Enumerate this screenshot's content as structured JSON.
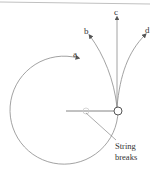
{
  "diagram": {
    "type": "circular-motion-trajectory",
    "labels": {
      "a": "a",
      "b": "b",
      "c": "c",
      "d": "d"
    },
    "caption_line1": "String",
    "caption_line2": "breaks",
    "colors": {
      "line": "#8a8a8a",
      "text": "#333333",
      "top_rule": "#b0b0b0"
    }
  }
}
